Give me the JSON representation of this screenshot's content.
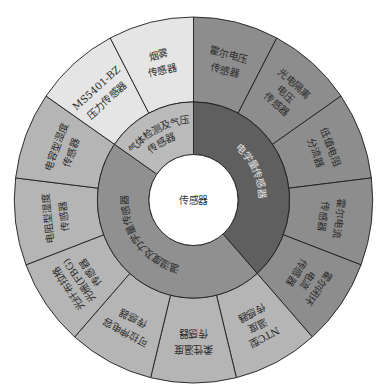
{
  "diagram": {
    "center": {
      "label": "传感器",
      "color": "#ffffff"
    },
    "stroke_color": "#1e1e1e",
    "leaf_text_color": "#2b2b2b",
    "categories": [
      {
        "label_lines": [
          "电学量传感器"
        ],
        "ring_color": "#5f5f5f",
        "leaf_color": "#8d8d8d",
        "label_color": "#e2e2e2",
        "children": [
          {
            "lines": [
              "霍尔电压",
              "传感器"
            ]
          },
          {
            "lines": [
              "光电隔离",
              "电压",
              "传感器"
            ]
          },
          {
            "lines": [
              "低值电阻",
              "分流器"
            ]
          },
          {
            "lines": [
              "霍尔电流",
              "传感器"
            ]
          },
          {
            "lines": [
              "霍尔闭环",
              "电流",
              "传感器"
            ]
          }
        ]
      },
      {
        "label_lines": [
          "温湿度及力学量传感器"
        ],
        "ring_color": "#909090",
        "leaf_color": "#b5b5b5",
        "label_color": "#2b2b2b",
        "children": [
          {
            "lines": [
              "NTC型",
              "温度",
              "传感器"
            ]
          },
          {
            "lines": [
              "柔性温度",
              "传感器"
            ]
          },
          {
            "lines": [
              "可拉伸电容",
              "传感器"
            ]
          },
          {
            "lines": [
              "光纤布拉格",
              "光栅(FBG)",
              "传感器"
            ]
          },
          {
            "lines": [
              "电阻型湿度",
              "传感器"
            ]
          },
          {
            "lines": [
              "电容型湿度",
              "传感器"
            ]
          }
        ]
      },
      {
        "label_lines": [
          "气体检测及气压",
          "传感器"
        ],
        "ring_color": "#bababa",
        "leaf_color": "#e5e5e5",
        "label_color": "#2b2b2b",
        "children": [
          {
            "lines": [
              "MS5401-BZ",
              "压力传感器"
            ]
          },
          {
            "lines": [
              "烟雾",
              "传感器"
            ]
          }
        ]
      }
    ]
  }
}
